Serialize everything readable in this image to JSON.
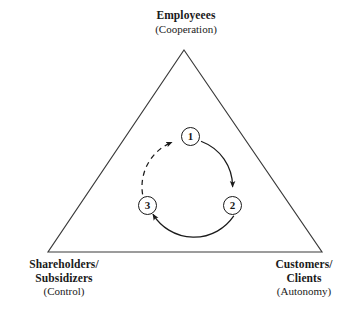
{
  "figure": {
    "stroke_color": "#2b2b2b",
    "dashed_stroke_color": "#2b2b2b",
    "background_color": "#ffffff"
  },
  "vertices": {
    "top": {
      "name": "Employeees",
      "qualifier": "(Cooperation)"
    },
    "bottom_left": {
      "name_line1": "Shareholders/",
      "name_line2": "Subsidizers",
      "qualifier": "(Control)"
    },
    "bottom_right": {
      "name_line1": "Customers/",
      "name_line2": "Clients",
      "qualifier": "(Autonomy)"
    }
  },
  "cycle": {
    "nodes": [
      {
        "label": "1"
      },
      {
        "label": "2"
      },
      {
        "label": "3"
      }
    ],
    "arcs": [
      {
        "from": "1",
        "to": "2",
        "style": "solid",
        "arrowhead": true
      },
      {
        "from": "2",
        "to": "3",
        "style": "solid",
        "arrowhead": true
      },
      {
        "from": "3",
        "to": "1",
        "style": "dashed",
        "arrowhead": true
      }
    ],
    "direction": "clockwise"
  }
}
